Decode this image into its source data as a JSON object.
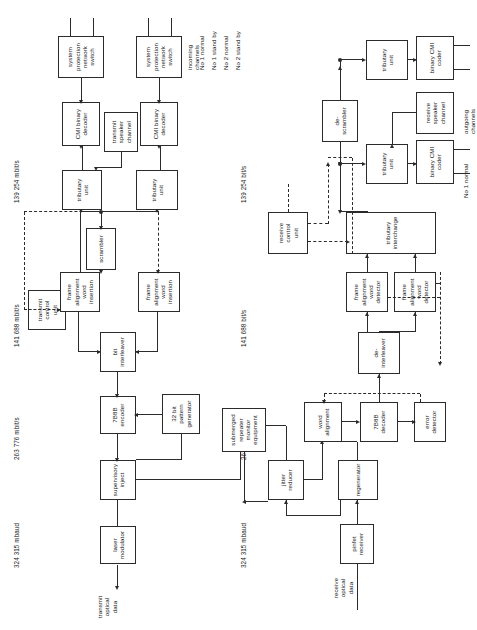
{
  "diagram": {
    "orientation": "rotated-90",
    "line_color": "#2b2b2b",
    "background": "#ffffff",
    "rates": {
      "tx_mbaud": "324 315 mbaud",
      "tx_line": "263 776 mbit/s",
      "tx_agg": "141 688 mbit/s",
      "tx_trib": "139 254 mbit/s",
      "rx_mbaud": "324 315 mbaud",
      "rx_line": "263 776 mbit/s",
      "rx_agg": "141 688 bit/s",
      "rx_trib": "139 254 bit/s"
    },
    "transmit": {
      "boxes": {
        "laser_modulator": "laser\nmodulator",
        "supervisory_inject": "supervisory\ninject",
        "encoder_7b8b": "7B8B\nencoder",
        "pattern_generator": "32 bit\npattern\ngenerator",
        "bit_interleaver": "bit\ninterleaver",
        "transmit_control_unit": "transmit\ncontrol\nunit",
        "faw_insertion_1": "frame\nalignment\nword\ninsertion",
        "faw_insertion_2": "frame\nalignment\nword\ninsertion",
        "scrambler": "scrambler",
        "tributary_unit_1": "tributary\nunit",
        "tributary_unit_2": "tributary\nunit",
        "cmi_decoder_1": "CMI binary\ndecoder",
        "cmi_decoder_2": "CMI binary\ndecoder",
        "transmit_speaker_channel": "transmit\nspeaker\nchannel",
        "sps_1": "system\nprotection\nnetwork\nswitch",
        "sps_2": "system\nprotection\nnetwork\nswitch"
      },
      "labels": {
        "transmit_optical_data": "transmit\noptical\ndata",
        "no1_normal": "No 1 normal",
        "no1_standby": "No 1 stand by",
        "no2_normal": "No 2 normal",
        "no2_standby": "No 2 stand by",
        "incoming_channels": "incoming\nchannels"
      }
    },
    "receive": {
      "boxes": {
        "pinfet_receiver": "pinfet\nreceiver",
        "regenerator": "regenerator",
        "word_alignment": "word\nalignment",
        "decoder_7b8b": "7B8B\ndecoder",
        "error_detector": "error\ndetector",
        "jitter_reducer": "jitter\nreducer",
        "submerged_repeater_monitor": "submerged\nrepeater\nmonitor\nequipment",
        "de_interleaver": "de-\ninterleaver",
        "faw_detector_1": "frame\nalignment\nword\ndetector",
        "faw_detector_2": "frame\nalignment\nword\ndetector",
        "tributary_interchange": "tributary\ninterchange",
        "receive_control_unit": "receive\ncontrol\nunit",
        "de_scrambler": "de-\nscrambler",
        "tributary_unit_1": "tributary\nunit",
        "tributary_unit_2": "tributary\nunit",
        "cmi_coder_1": "binary CMI\ncoder",
        "cmi_coder_2": "binary CMI\ncoder",
        "receive_speaker_channel": "receive\nspeaker\nchannel"
      },
      "labels": {
        "receive_optical_data": "receive\noptical\ndata",
        "no1_normal": "No 1 normal",
        "no1_standby": "No 1 stand by",
        "no2_normal": "No 2 normal",
        "no2_standby": "No 2 stand by",
        "outgoing_channels": "outgoing\nchannels"
      }
    }
  }
}
